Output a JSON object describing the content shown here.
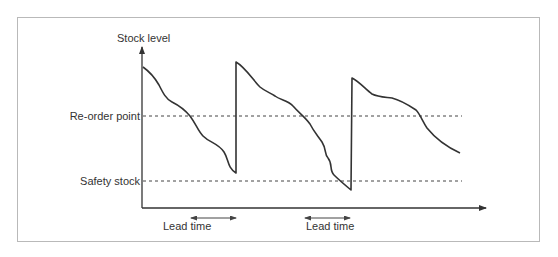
{
  "figure": {
    "y_axis_label": "Stock level",
    "reference_lines": [
      {
        "label": "Re-order point",
        "style": "dashed"
      },
      {
        "label": "Safety stock",
        "style": "dashed"
      }
    ],
    "annotations": [
      {
        "label": "Lead time",
        "type": "double-arrow"
      },
      {
        "label": "Lead time",
        "type": "double-arrow"
      }
    ],
    "colors": {
      "line": "#333333",
      "frame": "#b9b9b9",
      "text": "#333333"
    }
  }
}
